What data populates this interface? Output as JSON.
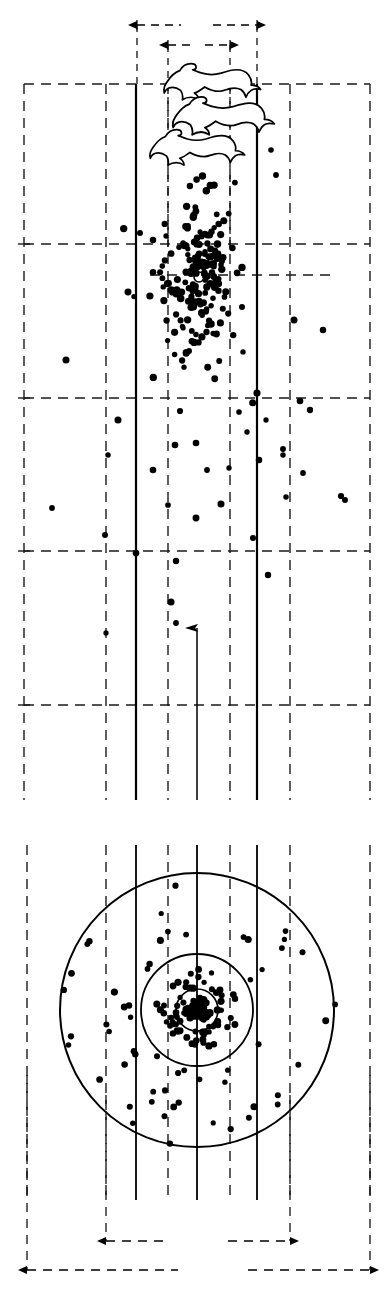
{
  "figure": {
    "background_color": "#ffffff",
    "ink_color": "#000000"
  },
  "panels": [
    {
      "id": "upper-panel",
      "name": "shot-corridor-panel",
      "label": "",
      "bounds": {
        "x": 24,
        "y": 20,
        "width": 346,
        "height": 780
      },
      "grid": {
        "style": "dashed",
        "vertical_x": [
          24,
          106,
          168,
          230,
          290,
          370
        ],
        "horizontal_y": [
          84,
          244,
          275,
          398,
          551,
          705
        ],
        "dash": "10 7",
        "color": "#1a1a1a",
        "width": 1.4
      },
      "corridor": {
        "name": "shot-corridor",
        "left_x": 136,
        "right_x": 257,
        "top_y": 84,
        "bottom_y": 800,
        "style": "solid",
        "width": 2.2
      },
      "axis_arrow": {
        "name": "flight-direction-arrow",
        "x": 197,
        "y_tail": 800,
        "y_head": 622,
        "direction": "up"
      },
      "center_marker": {
        "name": "pattern-center-marker",
        "cx": 199,
        "cy": 277,
        "r": 5
      },
      "dimension_arrows": [
        {
          "name": "outer-width-dimension",
          "y": 25,
          "x1": 137,
          "x2": 257,
          "gap": [
            181,
            213
          ],
          "label": ""
        },
        {
          "name": "inner-width-dimension",
          "y": 45,
          "x1": 168,
          "x2": 230,
          "gap": [
            190,
            205
          ],
          "label": ""
        }
      ],
      "hares": {
        "name": "running-hare-silhouettes",
        "count": 3,
        "positions": [
          {
            "x": 166,
            "y": 62,
            "scale": 1.0
          },
          {
            "x": 175,
            "y": 95,
            "scale": 1.05
          },
          {
            "x": 152,
            "y": 128,
            "scale": 0.98
          }
        ]
      },
      "pellets": {
        "name": "shot-pellets",
        "count": 228,
        "radius_mean": 3.0,
        "dense_zone": {
          "x1": 140,
          "x2": 258,
          "y1": 95,
          "y2": 400
        },
        "sparse_zone": {
          "x1": 24,
          "x2": 370,
          "y1": 90,
          "y2": 660
        }
      }
    },
    {
      "id": "lower-panel",
      "name": "pattern-board-panel",
      "label": "",
      "bounds": {
        "x": 24,
        "y": 840,
        "width": 346,
        "height": 420
      },
      "grid": {
        "style": "dashed",
        "vertical_x": [
          27,
          106,
          168,
          230,
          290,
          370
        ],
        "dash": "10 7",
        "color": "#1a1a1a",
        "width": 1.4
      },
      "solid_verticals_x": [
        136,
        197,
        257
      ],
      "center": {
        "cx": 197,
        "cy": 1010
      },
      "rings": [
        {
          "name": "outer-ring",
          "r": 137,
          "style": "solid",
          "width": 2.0
        },
        {
          "name": "middle-ring",
          "r": 56,
          "style": "solid",
          "width": 1.8
        },
        {
          "name": "inner-ring",
          "r": 21,
          "style": "solid",
          "width": 1.6
        }
      ],
      "pellets": {
        "name": "pattern-pellets",
        "count": 268,
        "radius_mean": 3.0,
        "core_fraction": 0.62
      },
      "dimension_arrows": [
        {
          "name": "inner-spread-dimension",
          "y": 1241,
          "x1": 106,
          "x2": 290,
          "gap": [
            170,
            228
          ],
          "label": ""
        },
        {
          "name": "outer-spread-dimension",
          "y": 1270,
          "x1": 27,
          "x2": 370,
          "gap": [
            178,
            248
          ],
          "label": ""
        }
      ],
      "extension_lines": [
        {
          "name": "left-inner-extension",
          "x": 106,
          "y1": 1095,
          "y2": 1241
        },
        {
          "name": "right-inner-extension",
          "x": 290,
          "y1": 1095,
          "y2": 1241
        },
        {
          "name": "left-outer-extension",
          "x": 27,
          "y1": 1075,
          "y2": 1270
        },
        {
          "name": "right-outer-extension",
          "x": 370,
          "y1": 1075,
          "y2": 1270
        }
      ]
    }
  ],
  "legend": {
    "caption": "",
    "notes": []
  }
}
